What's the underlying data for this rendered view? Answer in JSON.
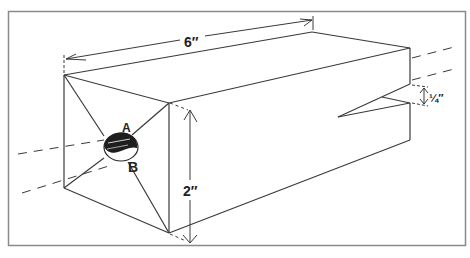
{
  "diagram": {
    "type": "isometric-technical-drawing",
    "colors": {
      "background": "#ffffff",
      "line": "#3a3a3a",
      "frame": "#888888",
      "ball_dark": "#1e1e1e"
    },
    "dimensions": {
      "length_label": "6″",
      "height_label": "2″",
      "notch_label": "¼″"
    },
    "points": {
      "A_label": "A",
      "B_label": "B"
    }
  }
}
